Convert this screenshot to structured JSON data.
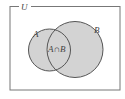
{
  "diagram": {
    "type": "venn",
    "universe_label": "U",
    "sets": [
      {
        "label": "A"
      },
      {
        "label": "B"
      }
    ],
    "intersection_label": "A∩B",
    "colors": {
      "fill": "#d3d3d3",
      "stroke": "#555555",
      "frame": "#777777",
      "background": "#ffffff"
    }
  }
}
